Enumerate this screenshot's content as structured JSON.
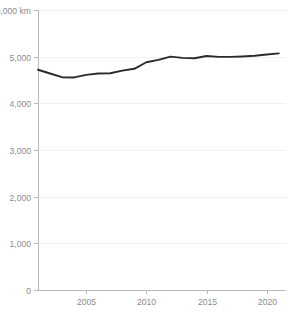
{
  "chart_data": {
    "type": "line",
    "title": "",
    "xlabel": "",
    "ylabel": "",
    "unit_label": "km",
    "ylim": [
      0,
      6000
    ],
    "xlim": [
      2001,
      2021.6
    ],
    "grid": true,
    "grid_axis": "y",
    "legend": false,
    "legend_position": "none",
    "y_ticks": [
      0,
      1000,
      2000,
      3000,
      4000,
      5000,
      6000
    ],
    "y_tick_labels": [
      "0",
      "1,000",
      "2,000",
      "3,000",
      "4,000",
      "5,000",
      "6,000 km"
    ],
    "x_ticks": [
      2005,
      2010,
      2015,
      2020
    ],
    "x_tick_labels": [
      "2005",
      "2010",
      "2015",
      "2020"
    ],
    "series": [
      {
        "name": "",
        "color": "#2b2b2b",
        "x": [
          2001,
          2002,
          2003,
          2004,
          2005,
          2006,
          2007,
          2008,
          2009,
          2010,
          2011,
          2012,
          2013,
          2014,
          2015,
          2016,
          2017,
          2018,
          2019,
          2020,
          2021
        ],
        "values": [
          4720,
          4640,
          4560,
          4555,
          4610,
          4640,
          4645,
          4700,
          4740,
          4880,
          4930,
          5000,
          4975,
          4965,
          5015,
          4995,
          4995,
          5005,
          5020,
          5045,
          5070
        ]
      }
    ]
  },
  "axes": {
    "y_axis_name": "y-axis",
    "x_axis_name": "x-axis"
  }
}
